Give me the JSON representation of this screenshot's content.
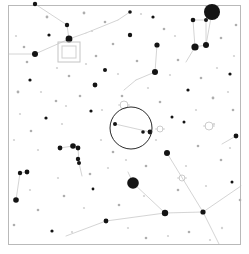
{
  "chart": {
    "type": "sky-map",
    "background_color": "#ffffff",
    "border_color": "#b9b9b9",
    "star_color": "#141414",
    "line_color": "#c9c9c9",
    "fov_circle_color": "#2a2a2a",
    "marker_color": "#c4c4c4",
    "width": 249,
    "height": 254
  },
  "frame": {
    "x": 8.5,
    "y": 5.5,
    "width": 232,
    "height": 239
  },
  "fov_indicator": {
    "label": "eyepiece-field-of-view",
    "cx": 131,
    "cy": 128,
    "r": 21
  },
  "field_marker": {
    "label": "telrad-square-marker",
    "outer": {
      "x": 58,
      "y": 42,
      "width": 22,
      "height": 20
    },
    "inner": {
      "x": 62,
      "y": 46,
      "width": 14,
      "height": 12
    }
  },
  "stars": [
    {
      "x": 212,
      "y": 12,
      "r": 8.0,
      "class": "star-dot"
    },
    {
      "x": 133,
      "y": 183,
      "r": 5.8,
      "class": "star-dot"
    },
    {
      "x": 195,
      "y": 47,
      "r": 3.6,
      "class": "star-dot"
    },
    {
      "x": 206,
      "y": 45,
      "r": 3.0,
      "class": "star-dot"
    },
    {
      "x": 69,
      "y": 39,
      "r": 3.4,
      "class": "star-dot"
    },
    {
      "x": 35,
      "y": 54,
      "r": 3.0,
      "class": "star-dot"
    },
    {
      "x": 193,
      "y": 20,
      "r": 2.3,
      "class": "star-dot"
    },
    {
      "x": 206,
      "y": 20,
      "r": 2.0,
      "class": "star-dot"
    },
    {
      "x": 67,
      "y": 25,
      "r": 2.2,
      "class": "star-dot"
    },
    {
      "x": 35,
      "y": 4,
      "r": 2.2,
      "class": "star-dot"
    },
    {
      "x": 157,
      "y": 45,
      "r": 2.6,
      "class": "star-dot"
    },
    {
      "x": 155,
      "y": 72,
      "r": 3.0,
      "class": "star-dot"
    },
    {
      "x": 95,
      "y": 85,
      "r": 2.4,
      "class": "star-dot"
    },
    {
      "x": 105,
      "y": 70,
      "r": 2.0,
      "class": "star-dot"
    },
    {
      "x": 60,
      "y": 148,
      "r": 2.4,
      "class": "star-dot"
    },
    {
      "x": 73,
      "y": 146,
      "r": 2.8,
      "class": "star-dot"
    },
    {
      "x": 78,
      "y": 148,
      "r": 2.4,
      "class": "star-dot"
    },
    {
      "x": 78,
      "y": 159,
      "r": 2.2,
      "class": "star-dot"
    },
    {
      "x": 79,
      "y": 163,
      "r": 2.0,
      "class": "star-dot"
    },
    {
      "x": 20,
      "y": 173,
      "r": 2.2,
      "class": "star-dot"
    },
    {
      "x": 27,
      "y": 172,
      "r": 2.4,
      "class": "star-dot"
    },
    {
      "x": 16,
      "y": 200,
      "r": 2.8,
      "class": "star-dot"
    },
    {
      "x": 167,
      "y": 153,
      "r": 3.0,
      "class": "star-dot"
    },
    {
      "x": 203,
      "y": 212,
      "r": 2.6,
      "class": "star-dot"
    },
    {
      "x": 165,
      "y": 213,
      "r": 3.2,
      "class": "star-dot"
    },
    {
      "x": 106,
      "y": 221,
      "r": 2.4,
      "class": "star-dot"
    },
    {
      "x": 236,
      "y": 136,
      "r": 2.4,
      "class": "star-dot"
    },
    {
      "x": 130,
      "y": 35,
      "r": 2.2,
      "class": "star-dot"
    },
    {
      "x": 115,
      "y": 124,
      "r": 2.0,
      "class": "star-dot"
    },
    {
      "x": 143,
      "y": 132,
      "r": 1.8,
      "class": "star-dot"
    },
    {
      "x": 150,
      "y": 132,
      "r": 2.4,
      "class": "star-dot"
    },
    {
      "x": 130,
      "y": 12,
      "r": 1.8,
      "class": "star-dot"
    },
    {
      "x": 153,
      "y": 17,
      "r": 1.6,
      "class": "star-dot"
    },
    {
      "x": 49,
      "y": 35,
      "r": 1.6,
      "class": "star-dot"
    },
    {
      "x": 30,
      "y": 80,
      "r": 1.6,
      "class": "star-dot"
    },
    {
      "x": 46,
      "y": 118,
      "r": 1.6,
      "class": "star-dot"
    },
    {
      "x": 91,
      "y": 111,
      "r": 1.6,
      "class": "star-dot"
    },
    {
      "x": 188,
      "y": 90,
      "r": 1.6,
      "class": "star-dot"
    },
    {
      "x": 230,
      "y": 74,
      "r": 1.6,
      "class": "star-dot"
    },
    {
      "x": 232,
      "y": 182,
      "r": 1.5,
      "class": "star-dot"
    },
    {
      "x": 52,
      "y": 231,
      "r": 1.6,
      "class": "star-dot"
    },
    {
      "x": 93,
      "y": 189,
      "r": 1.4,
      "class": "star-dot"
    },
    {
      "x": 184,
      "y": 122,
      "r": 1.5,
      "class": "star-dot"
    },
    {
      "x": 172,
      "y": 117,
      "r": 1.5,
      "class": "star-dot"
    },
    {
      "x": 18,
      "y": 92,
      "r": 1.4,
      "class": "star-faint"
    },
    {
      "x": 27,
      "y": 62,
      "r": 1.3,
      "class": "star-faint"
    },
    {
      "x": 24,
      "y": 47,
      "r": 1.3,
      "class": "star-faint"
    },
    {
      "x": 47,
      "y": 17,
      "r": 1.4,
      "class": "star-faint"
    },
    {
      "x": 84,
      "y": 13,
      "r": 1.4,
      "class": "star-faint"
    },
    {
      "x": 105,
      "y": 22,
      "r": 1.3,
      "class": "star-faint"
    },
    {
      "x": 113,
      "y": 44,
      "r": 1.3,
      "class": "star-faint"
    },
    {
      "x": 137,
      "y": 61,
      "r": 1.3,
      "class": "star-faint"
    },
    {
      "x": 164,
      "y": 29,
      "r": 1.3,
      "class": "star-faint"
    },
    {
      "x": 178,
      "y": 60,
      "r": 1.3,
      "class": "star-faint"
    },
    {
      "x": 221,
      "y": 38,
      "r": 1.3,
      "class": "star-faint"
    },
    {
      "x": 236,
      "y": 25,
      "r": 1.3,
      "class": "star-faint"
    },
    {
      "x": 201,
      "y": 78,
      "r": 1.3,
      "class": "star-faint"
    },
    {
      "x": 213,
      "y": 98,
      "r": 1.4,
      "class": "star-faint"
    },
    {
      "x": 233,
      "y": 110,
      "r": 1.3,
      "class": "star-faint"
    },
    {
      "x": 198,
      "y": 146,
      "r": 1.3,
      "class": "star-faint"
    },
    {
      "x": 221,
      "y": 160,
      "r": 1.3,
      "class": "star-faint"
    },
    {
      "x": 240,
      "y": 200,
      "r": 1.3,
      "class": "star-faint"
    },
    {
      "x": 189,
      "y": 232,
      "r": 1.3,
      "class": "star-faint"
    },
    {
      "x": 146,
      "y": 238,
      "r": 1.3,
      "class": "star-faint"
    },
    {
      "x": 119,
      "y": 205,
      "r": 1.3,
      "class": "star-faint"
    },
    {
      "x": 64,
      "y": 196,
      "r": 1.3,
      "class": "star-faint"
    },
    {
      "x": 38,
      "y": 210,
      "r": 1.3,
      "class": "star-faint"
    },
    {
      "x": 14,
      "y": 225,
      "r": 1.3,
      "class": "star-faint"
    },
    {
      "x": 31,
      "y": 131,
      "r": 1.3,
      "class": "star-faint"
    },
    {
      "x": 56,
      "y": 101,
      "r": 1.3,
      "class": "star-faint"
    },
    {
      "x": 80,
      "y": 96,
      "r": 1.3,
      "class": "star-faint"
    },
    {
      "x": 69,
      "y": 76,
      "r": 1.3,
      "class": "star-faint"
    },
    {
      "x": 96,
      "y": 56,
      "r": 1.3,
      "class": "star-faint"
    },
    {
      "x": 122,
      "y": 96,
      "r": 1.3,
      "class": "star-faint"
    },
    {
      "x": 160,
      "y": 102,
      "r": 1.3,
      "class": "star-faint"
    },
    {
      "x": 113,
      "y": 152,
      "r": 1.3,
      "class": "star-faint"
    },
    {
      "x": 146,
      "y": 166,
      "r": 1.3,
      "class": "star-faint"
    },
    {
      "x": 90,
      "y": 174,
      "r": 1.3,
      "class": "star-faint"
    },
    {
      "x": 178,
      "y": 190,
      "r": 1.3,
      "class": "star-faint"
    },
    {
      "x": 222,
      "y": 228,
      "r": 1.2,
      "class": "star-vfaint"
    },
    {
      "x": 206,
      "y": 186,
      "r": 1.1,
      "class": "star-vfaint"
    },
    {
      "x": 170,
      "y": 75,
      "r": 1.1,
      "class": "star-vfaint"
    },
    {
      "x": 141,
      "y": 14,
      "r": 1.1,
      "class": "star-vfaint"
    },
    {
      "x": 92,
      "y": 31,
      "r": 1.1,
      "class": "star-vfaint"
    },
    {
      "x": 57,
      "y": 68,
      "r": 1.1,
      "class": "star-vfaint"
    },
    {
      "x": 41,
      "y": 92,
      "r": 1.1,
      "class": "star-vfaint"
    },
    {
      "x": 20,
      "y": 114,
      "r": 1.1,
      "class": "star-vfaint"
    },
    {
      "x": 62,
      "y": 124,
      "r": 1.1,
      "class": "star-vfaint"
    },
    {
      "x": 101,
      "y": 140,
      "r": 1.1,
      "class": "star-vfaint"
    },
    {
      "x": 126,
      "y": 160,
      "r": 1.1,
      "class": "star-vfaint"
    },
    {
      "x": 156,
      "y": 140,
      "r": 1.1,
      "class": "star-vfaint"
    },
    {
      "x": 186,
      "y": 166,
      "r": 1.1,
      "class": "star-vfaint"
    },
    {
      "x": 214,
      "y": 124,
      "r": 1.1,
      "class": "star-vfaint"
    },
    {
      "x": 228,
      "y": 92,
      "r": 1.1,
      "class": "star-vfaint"
    },
    {
      "x": 196,
      "y": 110,
      "r": 1.1,
      "class": "star-vfaint"
    },
    {
      "x": 148,
      "y": 88,
      "r": 1.1,
      "class": "star-vfaint"
    },
    {
      "x": 118,
      "y": 74,
      "r": 1.1,
      "class": "star-vfaint"
    },
    {
      "x": 86,
      "y": 64,
      "r": 1.1,
      "class": "star-vfaint"
    },
    {
      "x": 66,
      "y": 106,
      "r": 1.1,
      "class": "star-vfaint"
    },
    {
      "x": 38,
      "y": 150,
      "r": 1.1,
      "class": "star-vfaint"
    },
    {
      "x": 58,
      "y": 178,
      "r": 1.1,
      "class": "star-vfaint"
    },
    {
      "x": 84,
      "y": 208,
      "r": 1.1,
      "class": "star-vfaint"
    },
    {
      "x": 128,
      "y": 228,
      "r": 1.1,
      "class": "star-vfaint"
    },
    {
      "x": 168,
      "y": 236,
      "r": 1.1,
      "class": "star-vfaint"
    },
    {
      "x": 210,
      "y": 240,
      "r": 1.1,
      "class": "star-vfaint"
    },
    {
      "x": 234,
      "y": 56,
      "r": 1.1,
      "class": "star-vfaint"
    },
    {
      "x": 16,
      "y": 36,
      "r": 1.1,
      "class": "star-vfaint"
    },
    {
      "x": 14,
      "y": 140,
      "r": 1.1,
      "class": "star-vfaint"
    },
    {
      "x": 102,
      "y": 110,
      "r": 1.1,
      "class": "star-vfaint"
    },
    {
      "x": 175,
      "y": 36,
      "r": 1.1,
      "class": "star-vfaint"
    },
    {
      "x": 217,
      "y": 68,
      "r": 1.1,
      "class": "star-vfaint"
    },
    {
      "x": 144,
      "y": 196,
      "r": 1.1,
      "class": "star-vfaint"
    },
    {
      "x": 72,
      "y": 232,
      "r": 1.1,
      "class": "star-vfaint"
    },
    {
      "x": 30,
      "y": 190,
      "r": 1.1,
      "class": "star-vfaint"
    },
    {
      "x": 108,
      "y": 168,
      "r": 1.1,
      "class": "star-vfaint"
    },
    {
      "x": 230,
      "y": 148,
      "r": 1.1,
      "class": "star-vfaint"
    }
  ],
  "constellation_lines": [
    {
      "x1": 9,
      "y1": 54,
      "x2": 35,
      "y2": 54
    },
    {
      "x1": 35,
      "y1": 54,
      "x2": 69,
      "y2": 39
    },
    {
      "x1": 69,
      "y1": 39,
      "x2": 67,
      "y2": 25
    },
    {
      "x1": 67,
      "y1": 25,
      "x2": 35,
      "y2": 4
    },
    {
      "x1": 69,
      "y1": 39,
      "x2": 86,
      "y2": 33
    },
    {
      "x1": 86,
      "y1": 33,
      "x2": 118,
      "y2": 20
    },
    {
      "x1": 118,
      "y1": 20,
      "x2": 130,
      "y2": 12
    },
    {
      "x1": 193,
      "y1": 20,
      "x2": 195,
      "y2": 47
    },
    {
      "x1": 206,
      "y1": 20,
      "x2": 206,
      "y2": 45
    },
    {
      "x1": 193,
      "y1": 20,
      "x2": 206,
      "y2": 20
    },
    {
      "x1": 195,
      "y1": 47,
      "x2": 206,
      "y2": 45
    },
    {
      "x1": 195,
      "y1": 47,
      "x2": 186,
      "y2": 62
    },
    {
      "x1": 206,
      "y1": 45,
      "x2": 212,
      "y2": 12
    },
    {
      "x1": 157,
      "y1": 45,
      "x2": 155,
      "y2": 72
    },
    {
      "x1": 155,
      "y1": 72,
      "x2": 136,
      "y2": 80
    },
    {
      "x1": 136,
      "y1": 80,
      "x2": 124,
      "y2": 90
    },
    {
      "x1": 115,
      "y1": 124,
      "x2": 150,
      "y2": 132
    },
    {
      "x1": 73,
      "y1": 146,
      "x2": 78,
      "y2": 148
    },
    {
      "x1": 78,
      "y1": 148,
      "x2": 79,
      "y2": 163
    },
    {
      "x1": 79,
      "y1": 163,
      "x2": 82,
      "y2": 176
    },
    {
      "x1": 60,
      "y1": 148,
      "x2": 73,
      "y2": 146
    },
    {
      "x1": 20,
      "y1": 173,
      "x2": 27,
      "y2": 172
    },
    {
      "x1": 20,
      "y1": 173,
      "x2": 16,
      "y2": 200
    },
    {
      "x1": 167,
      "y1": 153,
      "x2": 203,
      "y2": 212
    },
    {
      "x1": 203,
      "y1": 212,
      "x2": 165,
      "y2": 213
    },
    {
      "x1": 165,
      "y1": 213,
      "x2": 133,
      "y2": 183
    },
    {
      "x1": 165,
      "y1": 213,
      "x2": 106,
      "y2": 221
    },
    {
      "x1": 203,
      "y1": 212,
      "x2": 241,
      "y2": 186
    },
    {
      "x1": 203,
      "y1": 212,
      "x2": 219,
      "y2": 244
    },
    {
      "x1": 133,
      "y1": 183,
      "x2": 128,
      "y2": 172
    },
    {
      "x1": 236,
      "y1": 136,
      "x2": 222,
      "y2": 144
    },
    {
      "x1": 106,
      "y1": 221,
      "x2": 66,
      "y2": 236
    }
  ],
  "deep_sky_objects": [
    {
      "label": "open-cluster-glyph",
      "cx": 124,
      "cy": 105,
      "r": 4
    },
    {
      "label": "galaxy-glyph",
      "cx": 160,
      "cy": 129,
      "r": 3
    },
    {
      "label": "nebula-glyph",
      "cx": 209,
      "cy": 126,
      "r": 4
    },
    {
      "label": "cluster-glyph-lower",
      "cx": 182,
      "cy": 178,
      "r": 3
    }
  ]
}
